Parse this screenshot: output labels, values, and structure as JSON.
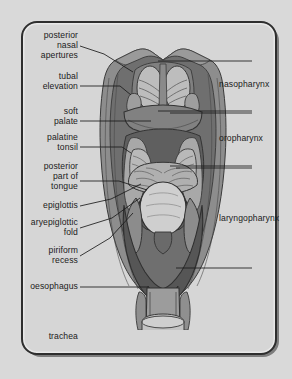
{
  "figure": {
    "type": "anatomical-diagram",
    "view": "posterior",
    "palette": {
      "page_background": "#d9d9d9",
      "panel_background": "#d6d6d6",
      "frame_border": "#2e2e2e",
      "frame_shadow": "#5d5d5d",
      "muscle_outer": "#8e8e8e",
      "muscle_mid": "#7a7a7a",
      "mucosa_dark": "#5a5a5a",
      "mucosa_mid": "#6e6e6e",
      "tissue_light": "#b4b4b4",
      "tissue_lighter": "#c6c6c6",
      "highlight": "#d2d2d2",
      "leader_line": "#1b1b1b",
      "label_text": "#1b1b1b"
    }
  },
  "left_labels": [
    {
      "id": "posterior-nasal-apertures",
      "text": "posterior\nnasal\napertures",
      "x": 78,
      "y": 46,
      "leader": [
        [
          80,
          46
        ],
        [
          104,
          54
        ],
        [
          133,
          72
        ]
      ]
    },
    {
      "id": "tubal-elevation",
      "text": "tubal\nelevation",
      "x": 78,
      "y": 82,
      "leader": [
        [
          80,
          86
        ],
        [
          120,
          86
        ],
        [
          131,
          95
        ]
      ]
    },
    {
      "id": "soft-palate",
      "text": "soft\npalate",
      "x": 78,
      "y": 117,
      "leader": [
        [
          80,
          121
        ],
        [
          151,
          121
        ]
      ]
    },
    {
      "id": "palatine-tonsil",
      "text": "palatine\ntonsil",
      "x": 78,
      "y": 143,
      "leader": [
        [
          80,
          147
        ],
        [
          122,
          147
        ],
        [
          131,
          153
        ]
      ]
    },
    {
      "id": "posterior-part-of-tongue",
      "text": "posterior\npart of\ntongue",
      "x": 78,
      "y": 177,
      "leader": [
        [
          80,
          181
        ],
        [
          119,
          181
        ],
        [
          147,
          190
        ]
      ]
    },
    {
      "id": "epiglottis",
      "text": "epiglottis",
      "x": 78,
      "y": 206,
      "leader": [
        [
          80,
          206
        ],
        [
          111,
          199
        ],
        [
          141,
          184
        ]
      ]
    },
    {
      "id": "aryepiglottic-fold",
      "text": "aryepiglottic\nfold",
      "x": 78,
      "y": 228,
      "leader": [
        [
          80,
          228
        ],
        [
          112,
          218
        ],
        [
          140,
          198
        ]
      ]
    },
    {
      "id": "piriform-recess",
      "text": "piriform\nrecess",
      "x": 78,
      "y": 256,
      "leader": [
        [
          80,
          256
        ],
        [
          110,
          238
        ],
        [
          133,
          213
        ]
      ]
    },
    {
      "id": "oesophagus",
      "text": "oesophagus",
      "x": 78,
      "y": 287,
      "leader": [
        [
          80,
          287
        ],
        [
          148,
          287
        ]
      ]
    },
    {
      "id": "trachea",
      "text": "trachea",
      "x": 78,
      "y": 337,
      "leader": [
        [
          80,
          337
        ],
        [
          152,
          337
        ]
      ]
    }
  ],
  "right_labels": [
    {
      "id": "nasopharynx",
      "text": "nasopharynx",
      "x": 219,
      "y": 85,
      "bracket": {
        "x": 212,
        "top": 61,
        "bottom": 111,
        "arm_to": 158
      }
    },
    {
      "id": "oropharynx",
      "text": "oropharynx",
      "x": 219,
      "y": 139,
      "bracket": {
        "x": 212,
        "top": 113,
        "bottom": 166,
        "arm_to": 170
      }
    },
    {
      "id": "laryngopharynx",
      "text": "laryngopharynx",
      "x": 219,
      "y": 219,
      "bracket": {
        "x": 212,
        "top": 168,
        "bottom": 268,
        "arm_to": 176
      }
    }
  ]
}
